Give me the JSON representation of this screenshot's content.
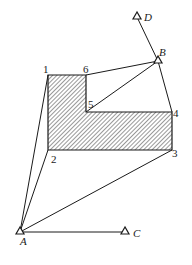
{
  "diagram": {
    "type": "survey-control-network",
    "stations": [
      {
        "id": "A",
        "label": "A",
        "x": 20,
        "y": 232
      },
      {
        "id": "B",
        "label": "B",
        "x": 158,
        "y": 61
      },
      {
        "id": "C",
        "label": "C",
        "x": 125,
        "y": 232
      },
      {
        "id": "D",
        "label": "D",
        "x": 137,
        "y": 17
      }
    ],
    "building_corners": [
      {
        "id": "1",
        "label": "1",
        "x": 48,
        "y": 75
      },
      {
        "id": "2",
        "label": "2",
        "x": 48,
        "y": 150
      },
      {
        "id": "3",
        "label": "3",
        "x": 172,
        "y": 150
      },
      {
        "id": "4",
        "label": "4",
        "x": 172,
        "y": 112
      },
      {
        "id": "5",
        "label": "5",
        "x": 86,
        "y": 112
      },
      {
        "id": "6",
        "label": "6",
        "x": 86,
        "y": 75
      }
    ],
    "sight_lines": [
      [
        "A",
        "C"
      ],
      [
        "A",
        "1"
      ],
      [
        "A",
        "2"
      ],
      [
        "A",
        "3"
      ],
      [
        "B",
        "D"
      ],
      [
        "B",
        "6"
      ],
      [
        "B",
        "5"
      ],
      [
        "B",
        "4"
      ]
    ],
    "building_fill": "hatched",
    "line_color": "#1a1a1a"
  }
}
